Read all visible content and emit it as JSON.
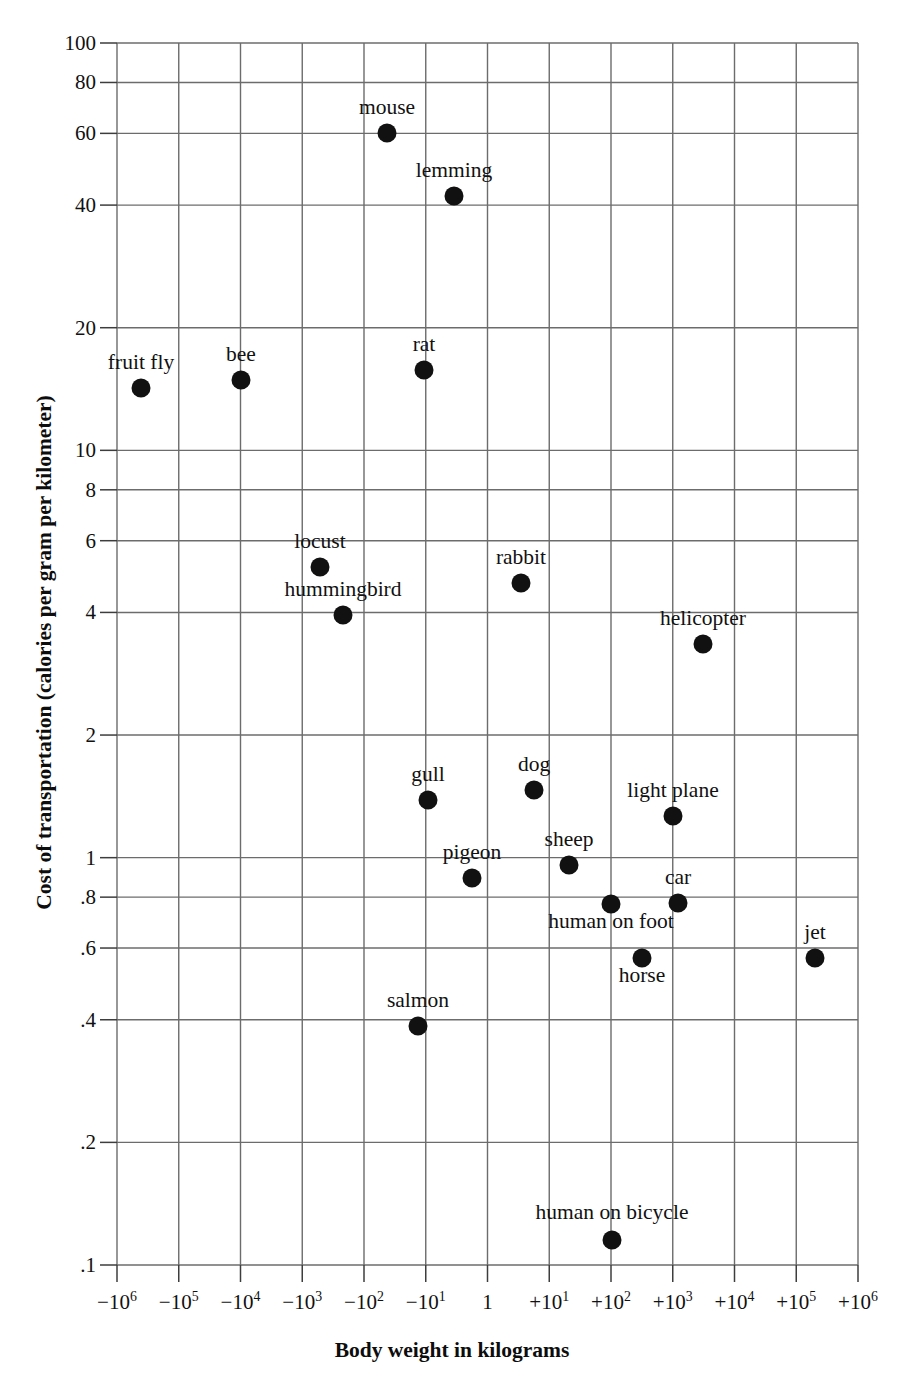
{
  "chart_data": {
    "type": "scatter",
    "title": "",
    "xlabel": "Body weight in kilograms",
    "ylabel": "Cost of transportation (calories per gram per kilometer)",
    "x_scale": "symmetric-log",
    "y_scale": "log",
    "grid": true,
    "legend": "none",
    "xlim": [
      -1000000,
      1000000
    ],
    "ylim": [
      0.1,
      100
    ],
    "xticks": [
      {
        "label": "-106",
        "base": "− 10",
        "exp": "6",
        "value": -1000000
      },
      {
        "label": "-105",
        "base": "− 10",
        "exp": "5",
        "value": -100000
      },
      {
        "label": "-104",
        "base": "− 10",
        "exp": "4",
        "value": -10000
      },
      {
        "label": "-103",
        "base": "− 10",
        "exp": "3",
        "value": -1000
      },
      {
        "label": "-102",
        "base": "− 10",
        "exp": "2",
        "value": -100
      },
      {
        "label": "-101",
        "base": "− 10",
        "exp": "1",
        "value": -10
      },
      {
        "label": "1",
        "base": "1",
        "exp": "",
        "value": 1
      },
      {
        "label": "+101",
        "base": "+ 10",
        "exp": "1",
        "value": 10
      },
      {
        "label": "+102",
        "base": "+ 10",
        "exp": "2",
        "value": 100
      },
      {
        "label": "+103",
        "base": "+ 10",
        "exp": "3",
        "value": 1000
      },
      {
        "label": "+104",
        "base": "+ 10",
        "exp": "4",
        "value": 10000
      },
      {
        "label": "+105",
        "base": "+ 10",
        "exp": "5",
        "value": 100000
      },
      {
        "label": "+106",
        "base": "+ 10",
        "exp": "6",
        "value": 1000000
      }
    ],
    "yticks": [
      {
        "label": "100",
        "value": 100
      },
      {
        "label": "80",
        "value": 80
      },
      {
        "label": "60",
        "value": 60
      },
      {
        "label": "40",
        "value": 40
      },
      {
        "label": "20",
        "value": 20
      },
      {
        "label": "10",
        "value": 10
      },
      {
        "label": "8",
        "value": 8
      },
      {
        "label": "6",
        "value": 6
      },
      {
        "label": "4",
        "value": 4
      },
      {
        "label": "2",
        "value": 2
      },
      {
        "label": "1",
        "value": 1
      },
      {
        "label": ".8",
        "value": 0.8
      },
      {
        "label": ".6",
        "value": 0.6
      },
      {
        "label": ".4",
        "value": 0.4
      },
      {
        "label": ".2",
        "value": 0.2
      },
      {
        "label": ".1",
        "value": 0.1
      }
    ],
    "points": [
      {
        "name": "mouse",
        "px": 387,
        "py": 133,
        "label_px": 387,
        "label_py": 116,
        "x_value": -30,
        "y_value": 60
      },
      {
        "name": "lemming",
        "px": 454,
        "py": 196,
        "label_px": 454,
        "label_py": 179,
        "x_value": -70,
        "y_value": 43
      },
      {
        "name": "fruit fly",
        "px": 141,
        "py": 388,
        "label_px": 141,
        "label_py": 371,
        "x_value": -300000,
        "y_value": 15
      },
      {
        "name": "bee",
        "px": 241,
        "py": 380,
        "label_px": 241,
        "label_py": 363,
        "x_value": -13000,
        "y_value": 15.5
      },
      {
        "name": "rat",
        "px": 424,
        "py": 370,
        "label_px": 424,
        "label_py": 353,
        "x_value": -65,
        "y_value": 16
      },
      {
        "name": "locust",
        "px": 320,
        "py": 567,
        "label_px": 320,
        "label_py": 550,
        "x_value": -400,
        "y_value": 5.5
      },
      {
        "name": "hummingbird",
        "px": 343,
        "py": 615,
        "label_px": 343,
        "label_py": 598,
        "x_value": -200,
        "y_value": 4.2
      },
      {
        "name": "rabbit",
        "px": 521,
        "py": 583,
        "label_px": 521,
        "label_py": 566,
        "x_value": 4,
        "y_value": 5.1
      },
      {
        "name": "helicopter",
        "px": 703,
        "py": 644,
        "label_px": 703,
        "label_py": 627,
        "x_value": 2500,
        "y_value": 3.6
      },
      {
        "name": "gull",
        "px": 428,
        "py": 800,
        "label_px": 428,
        "label_py": 783,
        "x_value": -55,
        "y_value": 1.5
      },
      {
        "name": "dog",
        "px": 534,
        "py": 790,
        "label_px": 534,
        "label_py": 773,
        "x_value": 6,
        "y_value": 1.55
      },
      {
        "name": "light plane",
        "px": 673,
        "py": 816,
        "label_px": 673,
        "label_py": 799,
        "x_value": 1100,
        "y_value": 1.35
      },
      {
        "name": "pigeon",
        "px": 472,
        "py": 878,
        "label_px": 472,
        "label_py": 861,
        "x_value": -2,
        "y_value": 1.0
      },
      {
        "name": "sheep",
        "px": 569,
        "py": 865,
        "label_px": 569,
        "label_py": 848,
        "x_value": 30,
        "y_value": 1.05
      },
      {
        "name": "human on foot",
        "px": 611,
        "py": 904,
        "label_px": 611,
        "label_py": 930,
        "x_value": 100,
        "y_value": 0.82
      },
      {
        "name": "car",
        "px": 678,
        "py": 903,
        "label_px": 678,
        "label_py": 886,
        "x_value": 1200,
        "y_value": 0.82
      },
      {
        "name": "horse",
        "px": 642,
        "py": 958,
        "label_px": 642,
        "label_py": 984,
        "x_value": 400,
        "y_value": 0.6
      },
      {
        "name": "jet",
        "px": 815,
        "py": 958,
        "label_px": 815,
        "label_py": 941,
        "x_value": 200000,
        "y_value": 0.6
      },
      {
        "name": "salmon",
        "px": 418,
        "py": 1026,
        "label_px": 418,
        "label_py": 1009,
        "x_value": -75,
        "y_value": 0.42
      },
      {
        "name": "human on bicycle",
        "px": 612,
        "py": 1240,
        "label_px": 612,
        "label_py": 1221,
        "x_value": 100,
        "y_value": 0.14
      }
    ]
  },
  "style": {
    "point_color": "#111111",
    "grid_color": "#6c6c6c",
    "axis_color": "#3d3d3d",
    "text_color": "#111111",
    "background": "#ffffff",
    "point_radius": 9.5
  },
  "geometry": {
    "plot_left": 117,
    "plot_right": 858,
    "plot_top": 43,
    "plot_bottom": 1265
  }
}
